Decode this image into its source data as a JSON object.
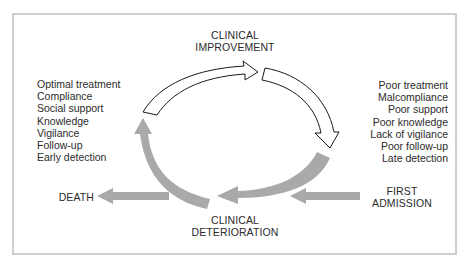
{
  "diagram": {
    "title_top": [
      "CLINICAL",
      "IMPROVEMENT"
    ],
    "title_bottom": [
      "CLINICAL",
      "DETERIORATION"
    ],
    "left_endpoint": "DEATH",
    "right_entry": [
      "FIRST",
      "ADMISSION"
    ],
    "positive_factors": [
      "Optimal treatment",
      "Compliance",
      "Social support",
      "Knowledge",
      "Vigilance",
      "Follow-up",
      "Early detection"
    ],
    "negative_factors": [
      "Poor treatment",
      "Malcompliance",
      "Poor support",
      "Poor knowledge",
      "Lack of vigilance",
      "Poor follow-up",
      "Late detection"
    ],
    "colors": {
      "frame": "#cfcfcf",
      "gray_arrow": "#a9a9a9",
      "outline_arrow": "#1a1a1a",
      "text": "#2b2b2b"
    }
  }
}
